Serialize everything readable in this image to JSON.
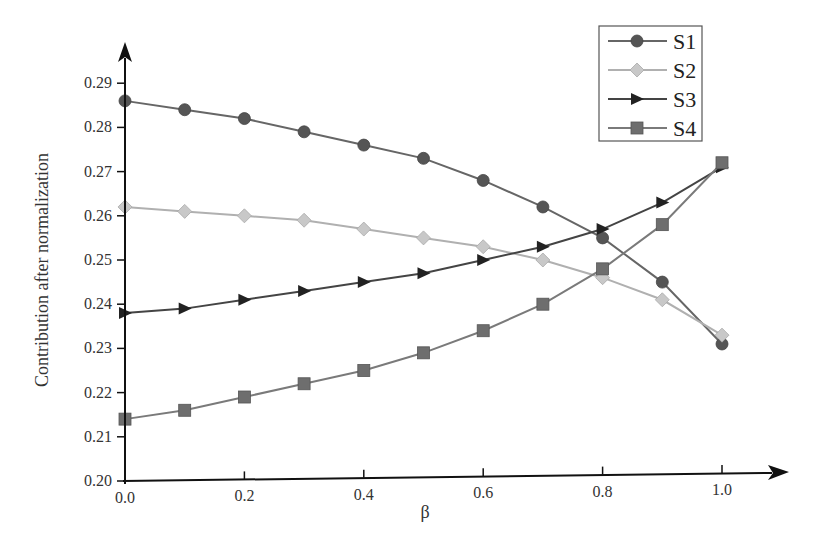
{
  "chart_data": {
    "type": "line",
    "title": "",
    "xlabel": "β",
    "ylabel": "Contribution after normalization",
    "x": [
      0.0,
      0.1,
      0.2,
      0.3,
      0.4,
      0.5,
      0.6,
      0.7,
      0.8,
      0.9,
      1.0
    ],
    "xlim": [
      0.0,
      1.0
    ],
    "ylim": [
      0.2,
      0.29
    ],
    "xticks": [
      "0.0",
      "0.2",
      "0.4",
      "0.6",
      "0.8",
      "1.0"
    ],
    "yticks": [
      "0.20",
      "0.21",
      "0.22",
      "0.23",
      "0.24",
      "0.25",
      "0.26",
      "0.27",
      "0.28",
      "0.29"
    ],
    "grid": false,
    "legend_position": "upper right",
    "series": [
      {
        "name": "S1",
        "marker": "circle",
        "color": "#555555",
        "line_color": "#666666",
        "values": [
          0.286,
          0.284,
          0.282,
          0.279,
          0.276,
          0.273,
          0.268,
          0.262,
          0.255,
          0.245,
          0.231
        ]
      },
      {
        "name": "S2",
        "marker": "diamond",
        "color": "#c8c8c8",
        "line_color": "#b0b0b0",
        "values": [
          0.262,
          0.261,
          0.26,
          0.259,
          0.257,
          0.255,
          0.253,
          0.25,
          0.246,
          0.241,
          0.233
        ]
      },
      {
        "name": "S3",
        "marker": "triangle-right",
        "color": "#222222",
        "line_color": "#444444",
        "values": [
          0.238,
          0.239,
          0.241,
          0.243,
          0.245,
          0.247,
          0.25,
          0.253,
          0.257,
          0.263,
          0.271
        ]
      },
      {
        "name": "S4",
        "marker": "square",
        "color": "#6e6e6e",
        "line_color": "#7a7a7a",
        "values": [
          0.214,
          0.216,
          0.219,
          0.222,
          0.225,
          0.229,
          0.234,
          0.24,
          0.248,
          0.258,
          0.272
        ]
      }
    ]
  }
}
